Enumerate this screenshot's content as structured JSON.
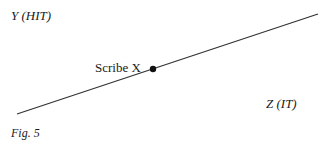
{
  "diagram": {
    "label_y": "Y  (HIT)",
    "label_point": "Scribe X",
    "label_z": "Z  (IT)",
    "caption": "Fig.  5",
    "line": {
      "x1": 17,
      "y1": 114,
      "x2": 318,
      "y2": 14
    },
    "point": {
      "cx": 153,
      "cy": 69
    },
    "color": "#1a1a1a"
  }
}
